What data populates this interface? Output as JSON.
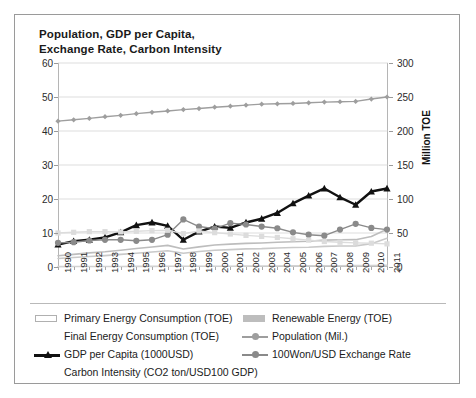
{
  "chart_data": {
    "type": "line",
    "title": "Population, GDP per Capita,\nExchange Rate, Carbon Intensity",
    "xlabel": "",
    "ylabel": "",
    "y2label": "Million TOE",
    "ylim": [
      0,
      60
    ],
    "y2lim": [
      0,
      300
    ],
    "yticks": [
      0,
      10,
      20,
      30,
      40,
      50,
      60
    ],
    "y2ticks": [
      0,
      50,
      100,
      150,
      200,
      250,
      300
    ],
    "grid": true,
    "legend_position": "bottom",
    "categories": [
      "1990",
      "1991",
      "1992",
      "1993",
      "1994",
      "1995",
      "1996",
      "1997",
      "1998",
      "1999",
      "2000",
      "2001",
      "2002",
      "2003",
      "2004",
      "2005",
      "2006",
      "2007",
      "2008",
      "2009",
      "2010",
      "2011"
    ],
    "series": [
      {
        "name": "Primary Energy Consumption (TOE)",
        "axis": "right",
        "marker": "none",
        "color": "#bdbdbd",
        "values": [
          16.5,
          18.6,
          20.7,
          22.4,
          24.6,
          27.1,
          29.4,
          31.8,
          26.5,
          29.6,
          32.4,
          33.6,
          34.7,
          35.4,
          36.5,
          37.1,
          37.9,
          39.5,
          40.0,
          40.2,
          44.9,
          55.6
        ]
      },
      {
        "name": "Final Energy Consumption (TOE)",
        "axis": "right",
        "marker": "none",
        "color": "#c9c9c9",
        "values": [
          12.6,
          14.0,
          15.4,
          16.8,
          18.5,
          20.2,
          22.0,
          23.9,
          20.3,
          22.7,
          24.7,
          25.6,
          26.6,
          27.0,
          28.0,
          28.6,
          29.0,
          30.4,
          30.9,
          31.1,
          34.1,
          42.2
        ]
      },
      {
        "name": "Renewable Energy (TOE)",
        "axis": "right",
        "marker": "none",
        "color": "#d2d2d2",
        "values": [
          0.6,
          0.7,
          0.7,
          0.8,
          0.8,
          0.9,
          0.9,
          1.0,
          1.0,
          1.1,
          1.1,
          1.2,
          1.3,
          1.4,
          1.5,
          1.6,
          1.7,
          1.8,
          1.9,
          2.0,
          2.2,
          2.4
        ]
      },
      {
        "name": "Population (Mil.)",
        "axis": "left",
        "marker": "diamond",
        "color": "#9e9e9e",
        "values": [
          42.9,
          43.3,
          43.7,
          44.2,
          44.6,
          45.1,
          45.5,
          45.9,
          46.3,
          46.6,
          47.0,
          47.3,
          47.6,
          47.9,
          48.0,
          48.1,
          48.3,
          48.5,
          48.6,
          48.7,
          49.4,
          50.0
        ]
      },
      {
        "name": "GDP per Capita (1000USD)",
        "axis": "left",
        "marker": "triangle",
        "color": "#111111",
        "values": [
          6.6,
          7.6,
          8.0,
          8.7,
          10.2,
          12.3,
          13.1,
          12.1,
          8.0,
          10.4,
          11.9,
          11.5,
          13.1,
          14.2,
          15.9,
          18.7,
          21.0,
          23.1,
          20.5,
          18.3,
          22.2,
          23.1
        ]
      },
      {
        "name": "100Won/USD Exchange Rate",
        "axis": "left",
        "marker": "circle",
        "color": "#8a8a8a",
        "values": [
          7.1,
          7.3,
          7.8,
          8.0,
          8.0,
          7.7,
          8.0,
          9.5,
          14.0,
          11.9,
          11.3,
          12.9,
          12.5,
          11.9,
          11.4,
          10.2,
          9.5,
          9.2,
          11.0,
          12.7,
          11.5,
          11.0
        ]
      },
      {
        "name": "Carbon Intensity (CO2 ton/USD100 GDP)",
        "axis": "left",
        "marker": "square",
        "color": "#dcdcdc",
        "values": [
          10.0,
          10.2,
          10.4,
          10.4,
          10.3,
          10.5,
          10.7,
          10.8,
          9.8,
          10.6,
          10.1,
          9.7,
          9.3,
          9.0,
          8.7,
          8.3,
          7.9,
          7.5,
          7.3,
          7.1,
          7.0,
          6.8
        ]
      }
    ]
  },
  "axis": {
    "right_title": "Million TOE"
  },
  "legend": {
    "items": [
      {
        "label": "Primary Energy Consumption (TOE)",
        "marker": "swatch-hollow",
        "color": "#ffffff"
      },
      {
        "label": "Renewable Energy (TOE)",
        "marker": "swatch-filled",
        "color": "#bdbdbd"
      },
      {
        "label": "Final Energy Consumption (TOE)",
        "marker": "none",
        "color": "#c9c9c9"
      },
      {
        "label": "Population (Mil.)",
        "marker": "line-diamond",
        "color": "#9e9e9e"
      },
      {
        "label": "GDP per Capita (1000USD)",
        "marker": "line-triangle",
        "color": "#111111"
      },
      {
        "label": "100Won/USD Exchange Rate",
        "marker": "line-circle",
        "color": "#8a8a8a"
      },
      {
        "label": "Carbon Intensity (CO2 ton/USD100 GDP)",
        "marker": "none",
        "color": "#dcdcdc"
      }
    ]
  }
}
